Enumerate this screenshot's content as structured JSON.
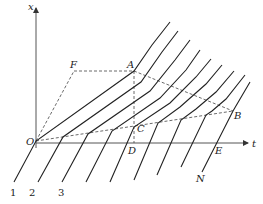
{
  "diagram": {
    "axes": {
      "vertical_label": "x",
      "horizontal_label": "t",
      "origin_label": "O"
    },
    "points": {
      "F": {
        "label": "F",
        "x": 74,
        "y": 71
      },
      "A": {
        "label": "A",
        "x": 134,
        "y": 71
      },
      "C": {
        "label": "C",
        "x": 134,
        "y": 127
      },
      "D": {
        "label": "D",
        "x": 134,
        "y": 143
      },
      "B": {
        "label": "B",
        "x": 233,
        "y": 111
      },
      "E": {
        "label": "E",
        "x": 215,
        "y": 143
      },
      "N": {
        "label": "N",
        "x": 200,
        "y": 178
      },
      "O": {
        "label": "O",
        "x": 36,
        "y": 141
      }
    },
    "line_labels": [
      "1",
      "2",
      "3"
    ],
    "dashed_regions": [
      "O-F-A-B-C-O region boundary",
      "A-C-D vertical"
    ],
    "colors": {
      "line": "#222222",
      "dashed": "#444444",
      "axis": "#333333"
    }
  }
}
